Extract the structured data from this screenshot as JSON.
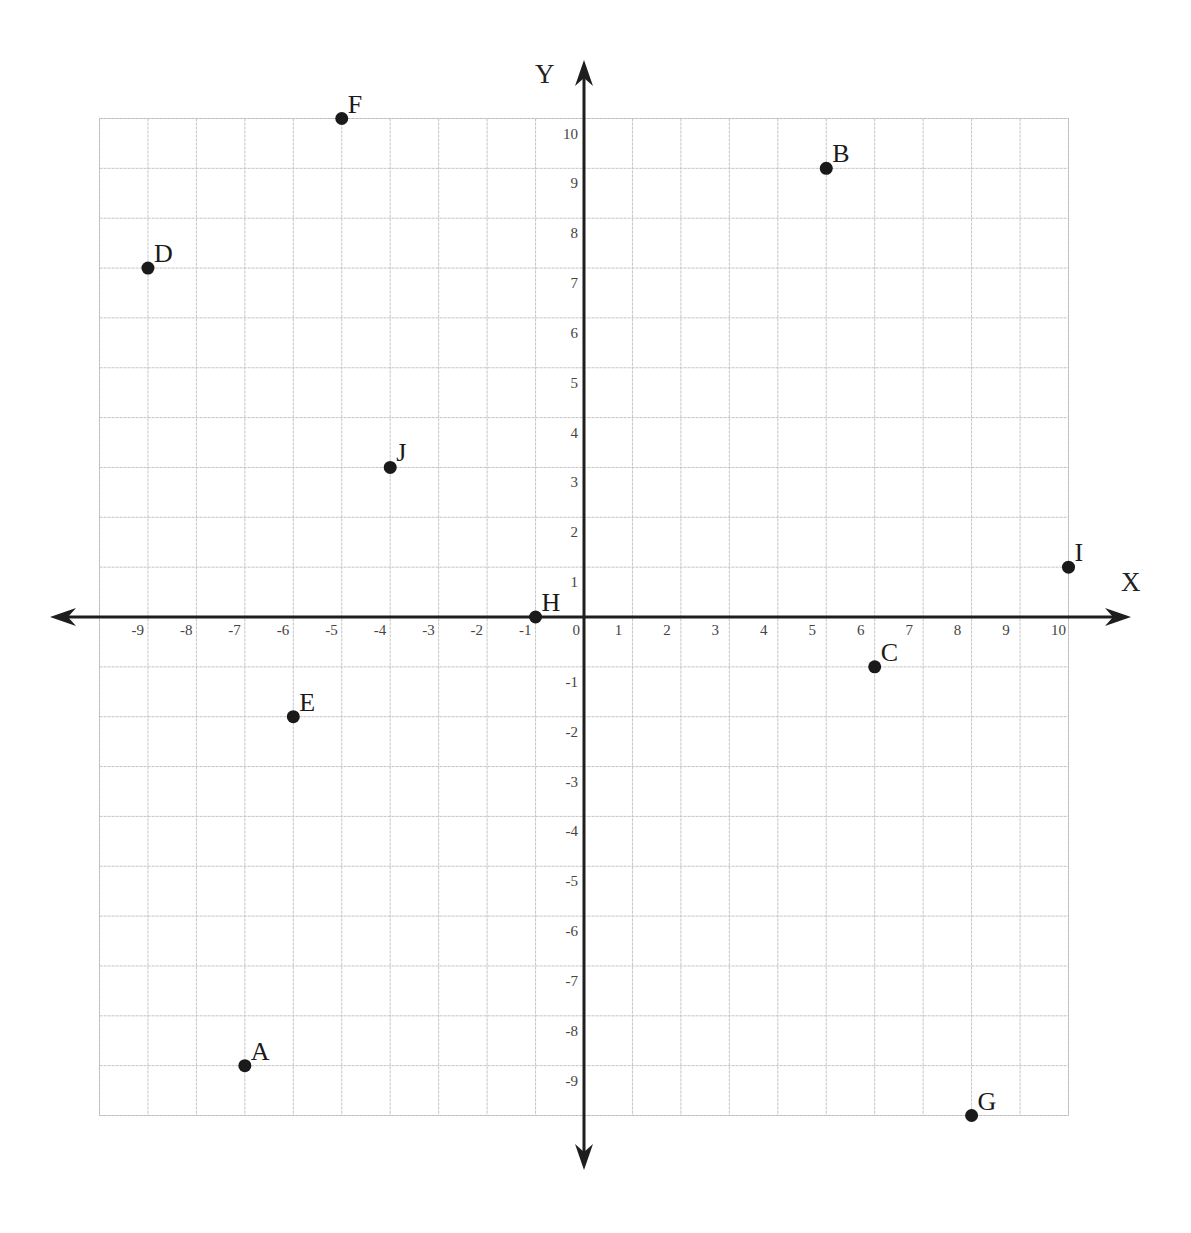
{
  "chart_data": {
    "type": "scatter",
    "title": "",
    "xlabel": "X",
    "ylabel": "Y",
    "xlim": [
      -10,
      10
    ],
    "ylim": [
      -10,
      10
    ],
    "grid": true,
    "legend": null,
    "x_tick_labels": [
      "-9",
      "-8",
      "-7",
      "-6",
      "-5",
      "-4",
      "-3",
      "-2",
      "-1",
      "0",
      "1",
      "2",
      "3",
      "4",
      "5",
      "6",
      "7",
      "8",
      "9",
      "10"
    ],
    "y_tick_labels": [
      "10",
      "9",
      "8",
      "7",
      "6",
      "5",
      "4",
      "3",
      "2",
      "1",
      "-1",
      "-2",
      "-3",
      "-4",
      "-5",
      "-6",
      "-7",
      "-8",
      "-9"
    ],
    "points": [
      {
        "label": "A",
        "x": -7,
        "y": -9
      },
      {
        "label": "B",
        "x": 5,
        "y": 9
      },
      {
        "label": "C",
        "x": 6,
        "y": -1
      },
      {
        "label": "D",
        "x": -9,
        "y": 7
      },
      {
        "label": "E",
        "x": -6,
        "y": -2
      },
      {
        "label": "F",
        "x": -5,
        "y": 10
      },
      {
        "label": "G",
        "x": 8,
        "y": -10
      },
      {
        "label": "H",
        "x": -1,
        "y": 0
      },
      {
        "label": "I",
        "x": 10,
        "y": 1
      },
      {
        "label": "J",
        "x": -4,
        "y": 3
      }
    ]
  },
  "colors": {
    "axis": "#1e1e1e",
    "grid": "#c4c4c4",
    "point": "#1a1a1a",
    "tick_label": "#444444",
    "background": "#ffffff"
  }
}
